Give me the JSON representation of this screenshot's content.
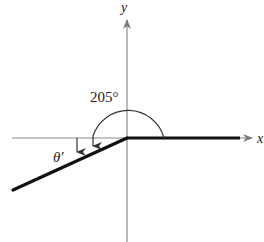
{
  "diagram": {
    "type": "angle-in-standard-position",
    "axes": {
      "x_label": "x",
      "y_label": "y"
    },
    "angle": {
      "label": "205°",
      "degrees": 205
    },
    "reference_angle": {
      "label": "θ′"
    },
    "colors": {
      "axis": "#8a8a8a",
      "ray": "#111111",
      "arc": "#333333",
      "text": "#222222"
    }
  }
}
